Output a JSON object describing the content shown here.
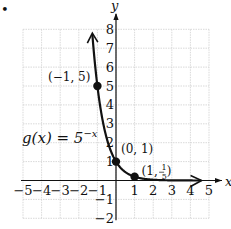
{
  "bullet": "•",
  "chart_data": {
    "type": "line",
    "title": "",
    "function_label": "g(x) = 5^-x",
    "function_label_parts": {
      "lhs": "g(x) = 5",
      "exp": "−x"
    },
    "xlabel": "x",
    "ylabel": "y",
    "xlim": [
      -5,
      5
    ],
    "ylim": [
      -2,
      8
    ],
    "grid": true,
    "x_ticks": [
      "−5",
      "−4",
      "−3",
      "−2",
      "−1",
      "1",
      "2",
      "3",
      "4",
      "5"
    ],
    "x_tick_values": [
      -5,
      -4,
      -3,
      -2,
      -1,
      1,
      2,
      3,
      4,
      5
    ],
    "y_ticks": [
      "8",
      "7",
      "6",
      "5",
      "4",
      "3",
      "2",
      "1",
      "−1",
      "−2"
    ],
    "y_tick_values": [
      8,
      7,
      6,
      5,
      4,
      3,
      2,
      1,
      -1,
      -2
    ],
    "series": [
      {
        "name": "g(x) = 5^-x",
        "x": [
          -1.29,
          -1,
          -0.5,
          0,
          0.5,
          1,
          2,
          3,
          4.6
        ],
        "y": [
          8,
          5,
          2.236,
          1,
          0.447,
          0.2,
          0.04,
          0.008,
          0.0006
        ]
      }
    ],
    "points": [
      {
        "x": -1,
        "y": 5,
        "label": "(−1, 5)"
      },
      {
        "x": 0,
        "y": 1,
        "label": "(0, 1)"
      },
      {
        "x": 1,
        "y": 0.2,
        "label_pre": "(1, ",
        "label_num": "1",
        "label_den": "5",
        "label_post": ")"
      }
    ]
  }
}
